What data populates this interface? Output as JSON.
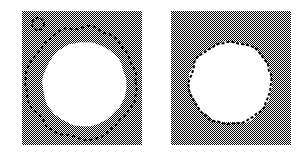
{
  "figure": {
    "background_color": "#ffffff",
    "width": 307,
    "height": 152,
    "panel_count": 2
  },
  "colors": {
    "dither_dark": "#000000",
    "dither_light": "#ffffff",
    "gray_apparent": "#808080",
    "blob_fill": "#ffffff",
    "contour_color": "#000000",
    "marker_color": "#000000"
  },
  "panels": [
    {
      "id": "panel-initial",
      "label": "initial contour",
      "x": 22,
      "y": 11,
      "width": 120,
      "height": 134,
      "background": "checkerboard-dither-gray",
      "blob": {
        "name": "white-region",
        "center_x": 62,
        "center_y": 73,
        "radius": 42,
        "fill": "#ffffff",
        "roughness": 0.018
      },
      "contour": {
        "name": "initial-snake-contour",
        "style": "dashed",
        "dash_on": 3,
        "dash_off": 3,
        "stroke_width": 2,
        "center_x": 60,
        "center_y": 71,
        "radius": 55,
        "closed": true,
        "jitter": 2.2,
        "state": "initial"
      },
      "marker": {
        "name": "seed-point-marker",
        "shape": "small-circle",
        "center_x": 8,
        "center_y": 5,
        "radius": 6,
        "stroke_width": 2
      }
    },
    {
      "id": "panel-converged",
      "label": "converged contour",
      "x": 171,
      "y": 11,
      "width": 120,
      "height": 134,
      "background": "checkerboard-dither-gray",
      "blob": {
        "name": "white-region",
        "center_x": 60,
        "center_y": 72,
        "radius": 41,
        "fill": "#ffffff",
        "roughness": 0.03
      },
      "contour": {
        "name": "converged-snake-contour",
        "style": "dashed",
        "dash_on": 3,
        "dash_off": 2,
        "stroke_width": 2,
        "center_x": 60,
        "center_y": 72,
        "radius": 41,
        "closed": true,
        "jitter": 1.4,
        "state": "converged"
      },
      "marker": null
    }
  ]
}
